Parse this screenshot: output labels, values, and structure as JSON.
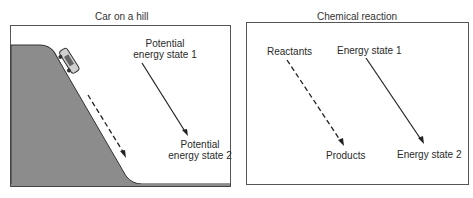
{
  "left_panel": {
    "title": "Car on a hill",
    "state1_line1": "Potential",
    "state1_line2": "energy state 1",
    "state2_line1": "Potential",
    "state2_line2": "energy state 2",
    "hill_color": "#8a8a8a"
  },
  "right_panel": {
    "title": "Chemical reaction",
    "reactants": "Reactants",
    "products": "Products",
    "state1": "Energy state 1",
    "state2": "Energy state 2"
  }
}
